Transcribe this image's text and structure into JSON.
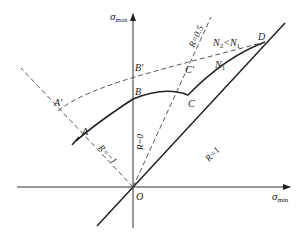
{
  "diagram": {
    "type": "fatigue-limit-diagram",
    "axes": {
      "y_label": "σ",
      "y_sub": "max",
      "x_label": "σ",
      "x_sub": "min",
      "origin_label": "O"
    },
    "rays": {
      "r_zero": "R=0",
      "r_half": "R=0.5",
      "r_one": "R=1",
      "r_minus_one": "R=−1"
    },
    "points": {
      "A": "A",
      "A_prime": "A′",
      "B": "B",
      "B_prime": "B′",
      "C": "C",
      "C_prime": "C′",
      "D": "D"
    },
    "curves": {
      "solid": "N",
      "solid_sub": "1",
      "dashed_a": "N",
      "dashed_a_sub": "2",
      "dashed_rel": "<N",
      "dashed_rel_sub": "1"
    },
    "colors": {
      "line": "#222222",
      "dashed": "#444444",
      "background": "#ffffff"
    }
  }
}
